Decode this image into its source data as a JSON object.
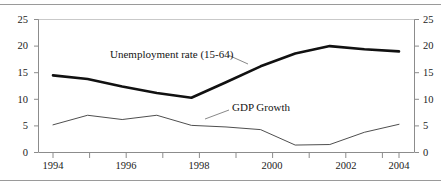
{
  "chart_data": {
    "type": "line",
    "title": "",
    "subtitle": "",
    "xlabel": "",
    "ylabel": "",
    "ylim": [
      0,
      25
    ],
    "xlim": [
      1994,
      2004
    ],
    "grid": false,
    "legend_position": "inline-annotations",
    "y_ticks": [
      0,
      5,
      10,
      15,
      20,
      25
    ],
    "y_ticks_right": [
      0,
      5,
      10,
      15,
      20,
      25
    ],
    "x_ticks_major": [
      1994,
      1996,
      1998,
      2000,
      2002,
      2004
    ],
    "x_ticks_minor": [
      1995,
      1997,
      1999,
      2001,
      2003
    ],
    "x": [
      1994,
      1995,
      1996,
      1997,
      1998,
      1999,
      2000,
      2001,
      2002,
      2003,
      2004
    ],
    "series": [
      {
        "name": "Unemployment rate (15-64)",
        "color": "#111111",
        "width": 2.6,
        "values": [
          14.5,
          13.8,
          12.4,
          11.2,
          10.3,
          13.2,
          16.2,
          18.6,
          20.0,
          19.4,
          19.0
        ]
      },
      {
        "name": "GDP Growth",
        "color": "#3a3a3a",
        "width": 0.9,
        "values": [
          5.2,
          7.0,
          6.2,
          7.0,
          5.1,
          4.8,
          4.3,
          1.4,
          1.5,
          3.8,
          5.3
        ]
      }
    ],
    "annotations": [
      {
        "text": "Unemployment rate (15-64)",
        "x_px": 110,
        "y_px": 53
      },
      {
        "text": "GDP Growth",
        "x_px": 233,
        "y_px": 106
      }
    ]
  },
  "axes": {
    "left_ticks": [
      {
        "value": "25"
      },
      {
        "value": "20"
      },
      {
        "value": "15"
      },
      {
        "value": "10"
      },
      {
        "value": "5"
      },
      {
        "value": "0"
      }
    ],
    "right_ticks": [
      {
        "value": "25"
      },
      {
        "value": "20"
      },
      {
        "value": "15"
      },
      {
        "value": "10"
      },
      {
        "value": "5"
      },
      {
        "value": "0"
      }
    ],
    "x_ticks": [
      {
        "value": "1994"
      },
      {
        "value": "1996"
      },
      {
        "value": "1998"
      },
      {
        "value": "2000"
      },
      {
        "value": "2002"
      },
      {
        "value": "2004"
      }
    ]
  },
  "labels": {
    "unemployment": "Unemployment rate (15-64)",
    "gdp": "GDP Growth"
  }
}
